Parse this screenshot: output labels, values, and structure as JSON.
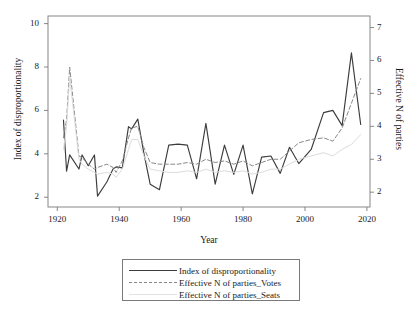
{
  "chart_data": {
    "type": "line",
    "title": "",
    "xlabel": "Year",
    "ylabel": "Index of disproportionality",
    "ylabel_right": "Effective N of parties",
    "xlim": [
      1917,
      2021
    ],
    "ylim": [
      1.55,
      10.35
    ],
    "ylim_right": [
      1.55,
      7.35
    ],
    "xticks": [
      1920,
      1940,
      1960,
      1980,
      2000,
      2020
    ],
    "yticks": [
      2,
      4,
      6,
      8,
      10
    ],
    "yticks_right": [
      2,
      3,
      4,
      5,
      6,
      7
    ],
    "grid": false,
    "legend_position": "below-plot",
    "series": [
      {
        "name": "Index of disproportionality",
        "axis": "left",
        "style": "solid",
        "color": "#3c3c3c",
        "x": [
          1922,
          1923,
          1924,
          1927,
          1928,
          1930,
          1932,
          1933,
          1936,
          1938,
          1939,
          1941,
          1943,
          1944,
          1946,
          1948,
          1950,
          1953,
          1956,
          1959,
          1962,
          1965,
          1968,
          1971,
          1974,
          1977,
          1980,
          1983,
          1986,
          1989,
          1992,
          1995,
          1998,
          2002,
          2006,
          2009,
          2012,
          2015,
          2018
        ],
        "y": [
          5.55,
          3.2,
          3.95,
          3.3,
          3.95,
          3.45,
          3.95,
          2.05,
          2.7,
          3.3,
          3.4,
          3.35,
          5.25,
          5.15,
          5.6,
          4.0,
          2.6,
          2.35,
          4.4,
          4.45,
          4.4,
          2.85,
          5.4,
          2.6,
          4.4,
          3.05,
          4.4,
          2.15,
          3.85,
          3.9,
          3.1,
          4.3,
          3.55,
          4.2,
          5.9,
          6.0,
          5.3,
          8.65,
          5.35
        ]
      },
      {
        "name": "Effective N of parties_Votes",
        "axis": "right",
        "style": "dashed",
        "color": "#888888",
        "x": [
          1922,
          1923,
          1924,
          1927,
          1928,
          1930,
          1932,
          1933,
          1936,
          1938,
          1939,
          1941,
          1943,
          1944,
          1946,
          1948,
          1950,
          1953,
          1956,
          1959,
          1962,
          1965,
          1968,
          1971,
          1974,
          1977,
          1980,
          1983,
          1986,
          1989,
          1992,
          1995,
          1998,
          2002,
          2006,
          2009,
          2012,
          2015,
          2018
        ],
        "y": [
          3.65,
          4.2,
          5.8,
          3.1,
          3.05,
          2.85,
          2.7,
          2.75,
          2.85,
          2.75,
          2.6,
          2.95,
          3.65,
          3.95,
          4.0,
          3.35,
          2.9,
          2.85,
          2.85,
          2.85,
          2.9,
          2.85,
          3.0,
          2.9,
          2.95,
          2.85,
          2.95,
          2.8,
          2.9,
          3.0,
          3.0,
          3.25,
          3.5,
          3.6,
          3.65,
          3.55,
          3.95,
          4.7,
          5.45
        ]
      },
      {
        "name": "Effective N of parties_Seats",
        "axis": "right",
        "style": "solid-light",
        "color": "#dcdcdc",
        "x": [
          1922,
          1923,
          1924,
          1927,
          1928,
          1930,
          1932,
          1933,
          1936,
          1938,
          1939,
          1941,
          1943,
          1944,
          1946,
          1948,
          1950,
          1953,
          1956,
          1959,
          1962,
          1965,
          1968,
          1971,
          1974,
          1977,
          1980,
          1983,
          1986,
          1989,
          1992,
          1995,
          1998,
          2002,
          2006,
          2009,
          2012,
          2015,
          2018
        ],
        "y": [
          3.3,
          4.0,
          5.5,
          3.0,
          2.85,
          2.7,
          2.6,
          2.55,
          2.6,
          2.55,
          2.45,
          2.7,
          3.3,
          3.6,
          3.6,
          3.1,
          2.7,
          2.65,
          2.6,
          2.6,
          2.65,
          2.6,
          2.7,
          2.6,
          2.65,
          2.6,
          2.65,
          2.55,
          2.6,
          2.7,
          2.7,
          2.85,
          3.0,
          3.1,
          3.2,
          3.1,
          3.3,
          3.45,
          3.75
        ]
      }
    ]
  },
  "axes": {
    "xlabel": "Year",
    "ylabel_left": "Index of disproportionality",
    "ylabel_right": "Effective N of parties",
    "xticks": [
      "1920",
      "1940",
      "1960",
      "1980",
      "2000",
      "2020"
    ],
    "yticks_left": [
      "2",
      "4",
      "6",
      "8",
      "10"
    ],
    "yticks_right": [
      "2",
      "3",
      "4",
      "5",
      "6",
      "7"
    ]
  },
  "legend": {
    "items": [
      {
        "label": "Index of disproportionality",
        "style": "solid",
        "color": "#3c3c3c"
      },
      {
        "label": "Effective N of parties_Votes",
        "style": "dashed",
        "color": "#888888"
      },
      {
        "label": "Effective N of parties_Seats",
        "style": "solid-light",
        "color": "#e2e2e2"
      }
    ]
  },
  "caption": {
    "text": ""
  },
  "colors": {
    "frame": "#7a7a7a",
    "text": "#1a1a1a",
    "series1": "#3c3c3c",
    "series2": "#888888",
    "series3": "#dcdcdc"
  }
}
